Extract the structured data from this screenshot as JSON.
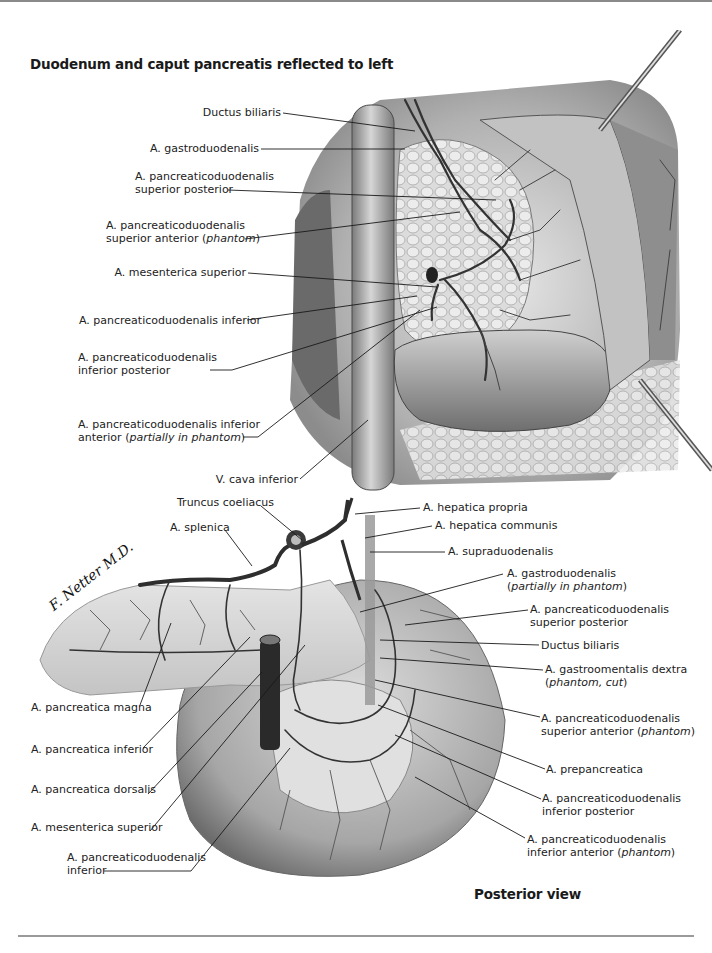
{
  "figure": {
    "top_panel": {
      "title": "Duodenum and caput pancreatis reflected to left",
      "labels": [
        {
          "id": "ductus-biliaris",
          "lines": [
            "Ductus biliaris"
          ]
        },
        {
          "id": "a-gastroduodenalis",
          "lines": [
            "A. gastroduodenalis"
          ]
        },
        {
          "id": "a-pd-sup-post",
          "lines": [
            "A. pancreaticoduodenalis",
            "superior posterior"
          ]
        },
        {
          "id": "a-pd-sup-ant",
          "lines": [
            "A. pancreaticoduodenalis",
            "superior anterior ",
            "phantom"
          ]
        },
        {
          "id": "a-mesenterica-superior",
          "lines": [
            "A. mesenterica superior"
          ]
        },
        {
          "id": "a-pd-inferior",
          "lines": [
            "A. pancreaticoduodenalis inferior"
          ]
        },
        {
          "id": "a-pd-inf-post",
          "lines": [
            "A. pancreaticoduodenalis",
            "inferior posterior"
          ]
        },
        {
          "id": "a-pd-inf-ant",
          "lines": [
            "A. pancreaticoduodenalis inferior",
            "anterior ",
            "partially in phantom"
          ]
        },
        {
          "id": "v-cava-inferior",
          "lines": [
            "V. cava inferior"
          ]
        }
      ]
    },
    "bottom_panel": {
      "caption": "Posterior view",
      "signature": "F. Netter M.D.",
      "labels_left": [
        {
          "id": "truncus-coeliacus",
          "lines": [
            "Truncus coeliacus"
          ]
        },
        {
          "id": "a-splenica",
          "lines": [
            "A. splenica"
          ]
        },
        {
          "id": "a-pancreatica-magna",
          "lines": [
            "A. pancreatica magna"
          ]
        },
        {
          "id": "a-pancreatica-inferior",
          "lines": [
            "A. pancreatica inferior"
          ]
        },
        {
          "id": "a-pancreatica-dorsalis",
          "lines": [
            "A. pancreatica dorsalis"
          ]
        },
        {
          "id": "a-mesenterica-superior-2",
          "lines": [
            "A. mesenterica superior"
          ]
        },
        {
          "id": "a-pd-inferior-2",
          "lines": [
            "A. pancreaticoduodenalis",
            "inferior"
          ]
        }
      ],
      "labels_right": [
        {
          "id": "a-hepatica-propria",
          "lines": [
            "A. hepatica propria"
          ]
        },
        {
          "id": "a-hepatica-communis",
          "lines": [
            "A. hepatica communis"
          ]
        },
        {
          "id": "a-supraduodenalis",
          "lines": [
            "A. supraduodenalis"
          ]
        },
        {
          "id": "a-gastroduodenalis-2",
          "lines": [
            "A. gastroduodenalis",
            "",
            "partially in phantom"
          ]
        },
        {
          "id": "a-pd-sup-post-2",
          "lines": [
            "A. pancreaticoduodenalis",
            "superior posterior"
          ]
        },
        {
          "id": "ductus-biliaris-2",
          "lines": [
            "Ductus biliaris"
          ]
        },
        {
          "id": "a-gastroomentalis-dextra",
          "lines": [
            "A. gastroomentalis dextra",
            "",
            "phantom, cut"
          ]
        },
        {
          "id": "a-pd-sup-ant-2",
          "lines": [
            "A. pancreaticoduodenalis",
            "superior anterior ",
            "phantom"
          ]
        },
        {
          "id": "a-prepancreatica",
          "lines": [
            "A. prepancreatica"
          ]
        },
        {
          "id": "a-pd-inf-post-2",
          "lines": [
            "A. pancreaticoduodenalis",
            "inferior posterior"
          ]
        },
        {
          "id": "a-pd-inf-ant-2",
          "lines": [
            "A. pancreaticoduodenalis",
            "inferior anterior ",
            "phantom"
          ]
        }
      ]
    },
    "colors": {
      "ink": "#1a1a1a",
      "vessel": "#3a3a3a",
      "tissue_light": "#d9d9d9",
      "tissue_mid": "#a8a8a8",
      "tissue_dark": "#5e5e5e",
      "rule": "#9a9a9a"
    }
  }
}
